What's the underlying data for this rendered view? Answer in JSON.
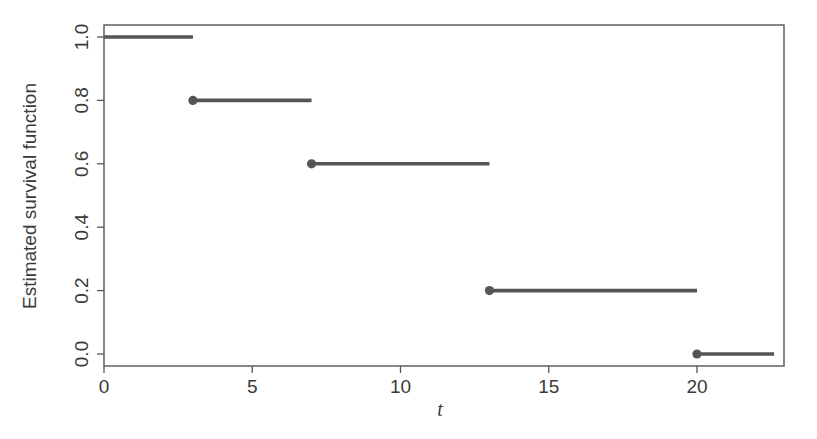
{
  "chart_data": {
    "type": "line",
    "subtype": "step",
    "title": "",
    "xlabel": "t",
    "ylabel": "Estimated survival function",
    "xlim": [
      0,
      22.8
    ],
    "ylim": [
      -0.04,
      1.04
    ],
    "xticks": [
      0,
      5,
      10,
      15,
      20
    ],
    "yticks": [
      0.0,
      0.2,
      0.4,
      0.6,
      0.8,
      1.0
    ],
    "xtick_labels": [
      "0",
      "5",
      "10",
      "15",
      "20"
    ],
    "ytick_labels": [
      "0.0",
      "0.2",
      "0.4",
      "0.6",
      "0.8",
      "1.0"
    ],
    "grid": false,
    "legend": null,
    "series": [
      {
        "name": "Kaplan-Meier estimate",
        "color": "#555555",
        "segments": [
          {
            "t_start": 0,
            "t_end": 3,
            "value": 1.0,
            "start_dot": false
          },
          {
            "t_start": 3,
            "t_end": 7,
            "value": 0.8,
            "start_dot": true
          },
          {
            "t_start": 7,
            "t_end": 13,
            "value": 0.6,
            "start_dot": true
          },
          {
            "t_start": 13,
            "t_end": 20,
            "value": 0.2,
            "start_dot": true
          },
          {
            "t_start": 20,
            "t_end": 22.6,
            "value": 0.0,
            "start_dot": true
          }
        ]
      }
    ]
  }
}
